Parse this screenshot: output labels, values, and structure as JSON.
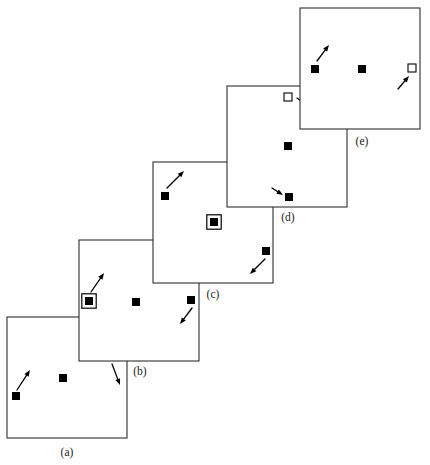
{
  "figure": {
    "title": "",
    "background_color": "#ffffff",
    "ink_color": "#000000",
    "frame_color": "#2e2e2e",
    "panel_width": 120,
    "panel_height": 121,
    "panel_step_x": 74,
    "panel_step_y": -77,
    "panels": [
      {
        "id": "a",
        "label": "(a)",
        "label_x": 67,
        "label_y": 456,
        "origin_x": 7,
        "origin_y": 317,
        "markers": [
          {
            "name": "marker-a-left",
            "kind": "filled-square",
            "x": 16,
            "y": 396,
            "size": 8,
            "arrow": {
              "direction": "up-right",
              "from_x": 17,
              "from_y": 390,
              "to_x": 30,
              "to_y": 370
            }
          },
          {
            "name": "marker-a-center",
            "kind": "filled-square",
            "x": 63,
            "y": 378,
            "size": 8,
            "arrow": null
          },
          {
            "name": "marker-a-right",
            "kind": "filled-square",
            "x": 114,
            "y": 356,
            "size": 8,
            "arrow": {
              "direction": "down-right",
              "from_x": 112,
              "from_y": 364,
              "to_x": 120,
              "to_y": 385
            }
          }
        ]
      },
      {
        "id": "b",
        "label": "(b)",
        "label_x": 140,
        "label_y": 375,
        "origin_x": 79,
        "origin_y": 240,
        "markers": [
          {
            "name": "marker-b-left-selected",
            "kind": "filled-square-ringed",
            "x": 89,
            "y": 301,
            "size": 8,
            "arrow": {
              "direction": "up-right",
              "from_x": 91,
              "from_y": 292,
              "to_x": 104,
              "to_y": 273
            }
          },
          {
            "name": "marker-b-center",
            "kind": "filled-square",
            "x": 136,
            "y": 302,
            "size": 8,
            "arrow": null
          },
          {
            "name": "marker-b-right",
            "kind": "filled-square",
            "x": 191,
            "y": 300,
            "size": 8,
            "arrow": {
              "direction": "down-left",
              "from_x": 192,
              "from_y": 308,
              "to_x": 180,
              "to_y": 324
            }
          }
        ]
      },
      {
        "id": "c",
        "label": "(c)",
        "label_x": 213,
        "label_y": 298,
        "origin_x": 153,
        "origin_y": 162,
        "markers": [
          {
            "name": "marker-c-left",
            "kind": "filled-square",
            "x": 165,
            "y": 196,
            "size": 8,
            "arrow": {
              "direction": "up-right",
              "from_x": 167,
              "from_y": 188,
              "to_x": 184,
              "to_y": 171
            }
          },
          {
            "name": "marker-c-center-selected",
            "kind": "filled-square-ringed",
            "x": 214,
            "y": 222,
            "size": 8,
            "arrow": null
          },
          {
            "name": "marker-c-right",
            "kind": "filled-square",
            "x": 266,
            "y": 251,
            "size": 8,
            "arrow": {
              "direction": "down-left",
              "from_x": 265,
              "from_y": 259,
              "to_x": 250,
              "to_y": 274
            }
          }
        ]
      },
      {
        "id": "d",
        "label": "(d)",
        "label_x": 288,
        "label_y": 221,
        "origin_x": 227,
        "origin_y": 86,
        "markers": [
          {
            "name": "marker-d-top-open",
            "kind": "open-square",
            "x": 288,
            "y": 97,
            "size": 8,
            "arrow": {
              "direction": "down-right",
              "from_x": 297,
              "from_y": 98,
              "to_x": 314,
              "to_y": 110
            }
          },
          {
            "name": "marker-d-center",
            "kind": "filled-square",
            "x": 288,
            "y": 146,
            "size": 8,
            "arrow": null
          },
          {
            "name": "marker-d-bottom",
            "kind": "filled-square",
            "x": 289,
            "y": 197,
            "size": 8,
            "arrow": {
              "direction": "down-right-incoming",
              "from_x": 272,
              "from_y": 188,
              "to_x": 283,
              "to_y": 195
            }
          }
        ]
      },
      {
        "id": "e",
        "label": "(e)",
        "label_x": 362,
        "label_y": 145,
        "origin_x": 300,
        "origin_y": 8,
        "markers": [
          {
            "name": "marker-e-left",
            "kind": "filled-square",
            "x": 315,
            "y": 69,
            "size": 8,
            "arrow": {
              "direction": "up-right",
              "from_x": 317,
              "from_y": 61,
              "to_x": 329,
              "to_y": 45
            }
          },
          {
            "name": "marker-e-center",
            "kind": "filled-square",
            "x": 362,
            "y": 69,
            "size": 8,
            "arrow": null
          },
          {
            "name": "marker-e-right-open",
            "kind": "open-square",
            "x": 412,
            "y": 68,
            "size": 8,
            "arrow": {
              "direction": "up-right-incoming",
              "from_x": 398,
              "from_y": 89,
              "to_x": 409,
              "to_y": 76
            }
          }
        ]
      }
    ]
  }
}
